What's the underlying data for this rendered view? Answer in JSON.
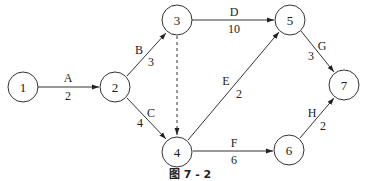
{
  "diagram": {
    "caption": "图 7 - 2",
    "nodes": [
      {
        "id": "1",
        "label": "1",
        "x": 23,
        "y": 87
      },
      {
        "id": "2",
        "label": "2",
        "x": 115,
        "y": 87
      },
      {
        "id": "3",
        "label": "3",
        "x": 177,
        "y": 20
      },
      {
        "id": "4",
        "label": "4",
        "x": 177,
        "y": 152
      },
      {
        "id": "5",
        "label": "5",
        "x": 290,
        "y": 20
      },
      {
        "id": "6",
        "label": "6",
        "x": 289,
        "y": 150
      },
      {
        "id": "7",
        "label": "7",
        "x": 344,
        "y": 85
      }
    ],
    "edges": [
      {
        "from": "1",
        "to": "2",
        "activity": "A",
        "duration": "2",
        "style": "solid"
      },
      {
        "from": "2",
        "to": "3",
        "activity": "B",
        "duration": "3",
        "style": "solid"
      },
      {
        "from": "2",
        "to": "4",
        "activity": "C",
        "duration": "4",
        "style": "solid"
      },
      {
        "from": "3",
        "to": "5",
        "activity": "D",
        "duration": "10",
        "style": "solid"
      },
      {
        "from": "3",
        "to": "4",
        "activity": "",
        "duration": "",
        "style": "dashed"
      },
      {
        "from": "4",
        "to": "5",
        "activity": "E",
        "duration": "2",
        "style": "solid"
      },
      {
        "from": "4",
        "to": "6",
        "activity": "F",
        "duration": "6",
        "style": "solid"
      },
      {
        "from": "5",
        "to": "7",
        "activity": "G",
        "duration": "3",
        "style": "solid"
      },
      {
        "from": "6",
        "to": "7",
        "activity": "H",
        "duration": "2",
        "style": "solid"
      }
    ]
  }
}
